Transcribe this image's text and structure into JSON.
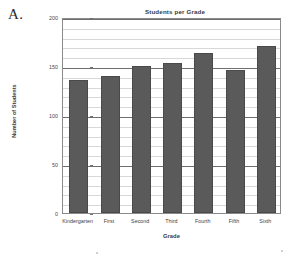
{
  "figure": {
    "label": "A."
  },
  "chart_data": {
    "type": "bar",
    "title": "Students per Grade",
    "xlabel": "Grade",
    "ylabel": "Number of Students",
    "categories": [
      "Kindergarten",
      "First",
      "Second",
      "Third",
      "Fourth",
      "Fifth",
      "Sixth"
    ],
    "values": [
      136,
      140,
      150,
      153,
      163,
      146,
      170
    ],
    "ylim": [
      0,
      200
    ],
    "ytick_labels": [
      "0",
      "50",
      "100",
      "150",
      "200"
    ],
    "ytick_values": [
      0,
      50,
      100,
      150,
      200
    ],
    "minor_tick_step": 10,
    "grid": "horizontal",
    "legend": "none",
    "bar_color": "#5a5a5a",
    "grid_color": "#d8d8d8",
    "axis_color": "#6f6f6f"
  }
}
